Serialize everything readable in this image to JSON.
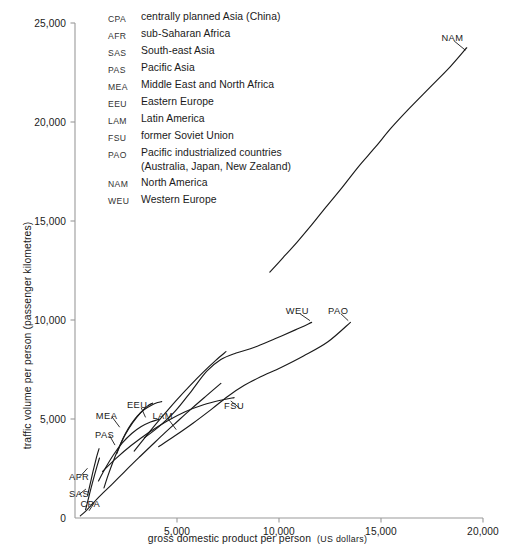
{
  "chart_data": {
    "type": "line",
    "title": "",
    "xlabel": "gross domestic product per person  (US dollars)",
    "ylabel": "traffic volume per person (passenger kilometres)",
    "xlim": [
      0,
      20000
    ],
    "ylim": [
      0,
      25000
    ],
    "xticks": [
      0,
      5000,
      10000,
      15000,
      20000
    ],
    "xtick_labels": [
      "0",
      "5,000",
      "10,000",
      "15,000",
      "20,000"
    ],
    "yticks": [
      0,
      5000,
      10000,
      15000,
      20000,
      25000
    ],
    "ytick_labels": [
      "0",
      "5,000",
      "10,000",
      "15,000",
      "20,000",
      "25,000"
    ],
    "grid": false,
    "legend_position": "top-left-inside",
    "line_color": "#1a1a1a",
    "axis_color": "#9a9a9a",
    "series": [
      {
        "name": "CPA",
        "label": "CPA",
        "full_name": "centrally planned Asia (China)",
        "x": [
          260,
          500,
          760,
          1050,
          1400,
          1800,
          2250,
          2700,
          3200,
          3750,
          4350,
          5000,
          5700,
          6450,
          7150
        ],
        "y": [
          110,
          320,
          600,
          930,
          1290,
          1690,
          2150,
          2620,
          3120,
          3660,
          4250,
          4860,
          5510,
          6180,
          6800
        ]
      },
      {
        "name": "AFR",
        "label": "AFR",
        "full_name": "sub-Saharan Africa",
        "x": [
          620,
          700,
          790,
          880,
          980,
          1080,
          1180
        ],
        "y": [
          1150,
          1520,
          1930,
          2340,
          2760,
          3160,
          3500
        ]
      },
      {
        "name": "SAS",
        "label": "SAS",
        "full_name": "South-east Asia",
        "x": [
          520,
          610,
          720,
          840,
          960,
          1080,
          1200
        ],
        "y": [
          420,
          790,
          1240,
          1720,
          2180,
          2620,
          3030
        ]
      },
      {
        "name": "PAS",
        "label": "PAS",
        "full_name": "Pacific Asia",
        "x": [
          1150,
          1480,
          1880,
          2320,
          2780,
          3250,
          3700,
          4100
        ],
        "y": [
          1870,
          2500,
          3180,
          3790,
          4270,
          4620,
          4850,
          4980
        ]
      },
      {
        "name": "MEA",
        "label": "MEA",
        "full_name": "Middle East and North Africa",
        "x": [
          1420,
          1620,
          1860,
          2140,
          2460,
          2820,
          3200,
          3550,
          3800
        ],
        "y": [
          1520,
          2150,
          2830,
          3520,
          4200,
          4800,
          5300,
          5650,
          5800
        ]
      },
      {
        "name": "EEU",
        "label": "EEU",
        "full_name": "Eastern Europe",
        "x": [
          2050,
          2250,
          2480,
          2750,
          3050,
          3400,
          3750,
          4050,
          4250
        ],
        "y": [
          3250,
          3780,
          4280,
          4740,
          5150,
          5480,
          5700,
          5830,
          5880
        ]
      },
      {
        "name": "LAM",
        "label": "LAM",
        "full_name": "Latin America",
        "x": [
          2900,
          3350,
          3850,
          4400,
          5000,
          5650,
          6300,
          6900,
          7400
        ],
        "y": [
          3380,
          3960,
          4600,
          5270,
          5980,
          6700,
          7380,
          7960,
          8400
        ]
      },
      {
        "name": "FSU",
        "label": "FSU",
        "full_name": "former Soviet Union",
        "x": [
          1350,
          2000,
          2750,
          3600,
          4500,
          5400,
          6300,
          7150,
          7800
        ],
        "y": [
          2350,
          3000,
          3660,
          4310,
          4890,
          5370,
          5720,
          5950,
          6080
        ]
      },
      {
        "name": "WEU",
        "label": "WEU",
        "full_name": "Western Europe",
        "x": [
          3400,
          4100,
          4900,
          5700,
          6450,
          7150,
          7900,
          8800,
          9800,
          10800,
          11600
        ],
        "y": [
          4050,
          4600,
          5380,
          6400,
          7400,
          8000,
          8330,
          8620,
          9050,
          9500,
          9880
        ]
      },
      {
        "name": "PAO",
        "label": "PAO",
        "full_name": "Pacific industrialized countries (Australia, Japan, New Zealand)",
        "x": [
          4100,
          4900,
          5800,
          6700,
          7500,
          8300,
          9100,
          10100,
          11200,
          12400,
          13500
        ],
        "y": [
          3600,
          4150,
          4800,
          5500,
          6150,
          6700,
          7130,
          7600,
          8180,
          8900,
          9880
        ]
      },
      {
        "name": "NAM",
        "label": "NAM",
        "full_name": "North America",
        "x": [
          9550,
          10200,
          10900,
          11600,
          12300,
          13100,
          13900,
          14700,
          15500,
          16400,
          17400,
          18400,
          19200
        ],
        "y": [
          12420,
          13150,
          13950,
          14800,
          15700,
          16700,
          17750,
          18700,
          19700,
          20700,
          21750,
          22800,
          23750
        ]
      }
    ],
    "annotations": [
      {
        "text": "AFR",
        "x": 200,
        "y": 2050
      },
      {
        "text": "SAS",
        "x": 200,
        "y": 1200
      },
      {
        "text": "CPA",
        "x": 750,
        "y": 700
      },
      {
        "text": "PAS",
        "x": 1450,
        "y": 4200
      },
      {
        "text": "MEA",
        "x": 1550,
        "y": 5150
      },
      {
        "text": "EEU",
        "x": 3050,
        "y": 5700
      },
      {
        "text": "LAM",
        "x": 4300,
        "y": 5150
      },
      {
        "text": "FSU",
        "x": 7800,
        "y": 5650
      },
      {
        "text": "WEU",
        "x": 10900,
        "y": 10450
      },
      {
        "text": "PAO",
        "x": 12900,
        "y": 10450
      },
      {
        "text": "NAM",
        "x": 18500,
        "y": 24250
      }
    ]
  },
  "legend": {
    "items": [
      {
        "code": "CPA",
        "name": "centrally planned Asia (China)",
        "sub": ""
      },
      {
        "code": "AFR",
        "name": "sub-Saharan Africa",
        "sub": ""
      },
      {
        "code": "SAS",
        "name": "South-east Asia",
        "sub": ""
      },
      {
        "code": "PAS",
        "name": "Pacific Asia",
        "sub": ""
      },
      {
        "code": "MEA",
        "name": "Middle East and North Africa",
        "sub": ""
      },
      {
        "code": "EEU",
        "name": "Eastern Europe",
        "sub": ""
      },
      {
        "code": "LAM",
        "name": "Latin America",
        "sub": ""
      },
      {
        "code": "FSU",
        "name": "former Soviet Union",
        "sub": ""
      },
      {
        "code": "PAO",
        "name": "Pacific industrialized countries",
        "sub": "(Australia, Japan, New Zealand)"
      },
      {
        "code": "NAM",
        "name": "North America",
        "sub": ""
      },
      {
        "code": "WEU",
        "name": "Western Europe",
        "sub": ""
      }
    ]
  },
  "axis_titles": {
    "x_main": "gross domestic product per person",
    "x_unit": "(US dollars)",
    "y": "traffic volume per person (passenger kilometres)"
  }
}
